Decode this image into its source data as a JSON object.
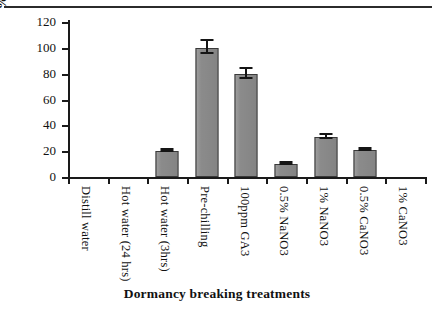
{
  "chart_data": {
    "type": "bar",
    "title": "",
    "xlabel": "Dormancy breaking treatments",
    "ylabel": "% germination",
    "ylim": [
      0,
      120
    ],
    "ytick_labels": [
      "120",
      "100",
      "80",
      "60",
      "40",
      "20",
      "0"
    ],
    "yticks": [
      120,
      100,
      80,
      60,
      40,
      20,
      0
    ],
    "grid": false,
    "legend": "none",
    "bar_color": "#8b8b8b",
    "bar_edge_color": "#3a3a3a",
    "axis_color": "#1a1a1a",
    "categories": [
      "Distill water",
      "Hot water (24 hrs)",
      "Hot water (3hrs)",
      "Pre-chilling",
      "100ppm GA3",
      "0.5% NaNO3",
      "1% NaNO3",
      "0.5% CaNO3",
      "1% CaNO3"
    ],
    "values": [
      0,
      0,
      20,
      100,
      80,
      10,
      31,
      21,
      0
    ],
    "errors": [
      0,
      0,
      1,
      5,
      4,
      1,
      1.5,
      1,
      0
    ]
  }
}
